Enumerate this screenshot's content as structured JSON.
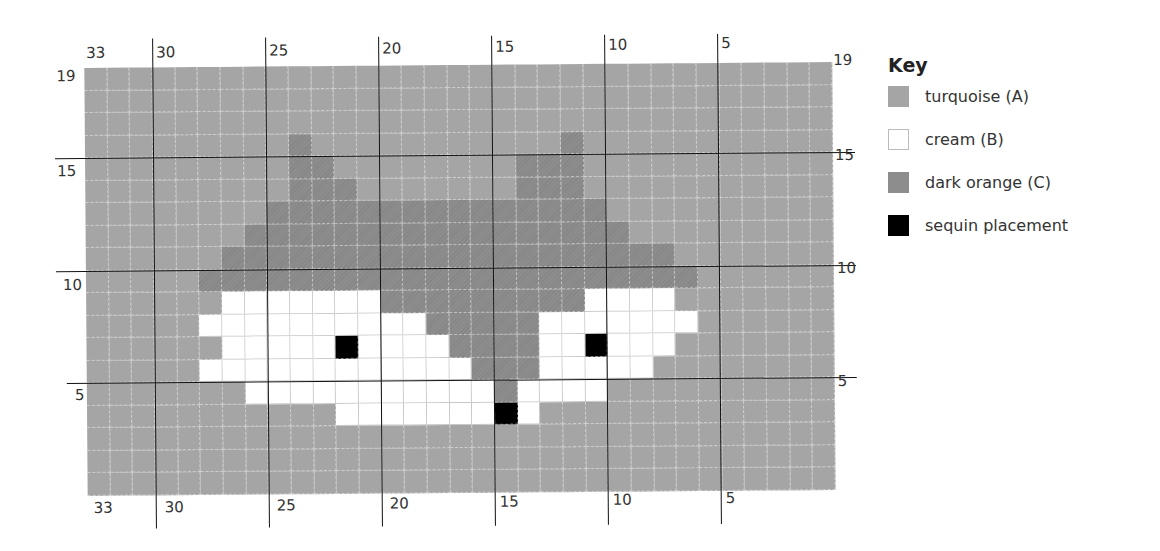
{
  "key": {
    "title": "Key",
    "items": [
      {
        "code": "A",
        "label": "turquoise (A)",
        "color": "#a5a5a5"
      },
      {
        "code": "B",
        "label": "cream (B)",
        "color": "#ffffff"
      },
      {
        "code": "C",
        "label": "dark orange (C)",
        "color": "#8d8d8d"
      },
      {
        "code": "S",
        "label": "sequin placement",
        "color": "#000000"
      }
    ]
  },
  "axes": {
    "top_labels": [
      "33",
      "30",
      "25",
      "20",
      "15",
      "10",
      "5"
    ],
    "bottom_labels": [
      "33",
      "30",
      "25",
      "20",
      "15",
      "10",
      "5"
    ],
    "left_labels": [
      "19",
      "15",
      "10",
      "5"
    ],
    "right_labels": [
      "19",
      "15",
      "10",
      "5"
    ]
  },
  "chart_data": {
    "type": "heatmap",
    "columns": 33,
    "rows": 19,
    "column_order": "33 (left) to 1 (right)",
    "row_order": "19 (top) to 1 (bottom)",
    "x_tick_labels": [
      "33",
      "30",
      "25",
      "20",
      "15",
      "10",
      "5"
    ],
    "y_tick_labels": [
      "19",
      "15",
      "10",
      "5"
    ],
    "legend": {
      "A": "turquoise (A)",
      "B": "cream (B)",
      "C": "dark orange (C)",
      "S": "sequin placement"
    },
    "grid": [
      "AAAAAAAAAAAAAAAAAAAAAAAAAAAAAAAAA",
      "AAAAAAAAAAAAAAAAAAAAAAAAAAAAAAAAA",
      "AAAAAAAAAAAAAAAAAAAAAAAAAAAAAAAAA",
      "AAAAAAAAACAAAAAAAAAAACAAAAAAAAAAA",
      "AAAAAAAAACCAAAAAAAACCCAAAAAAAAAAA",
      "AAAAAAAAACCCAAAAAAACCCAAAAAAAAAAA",
      "AAAAAAAACCCCCCCCCCCCCCCAAAAAAAAAA",
      "AAAAAAACCCCCCCCCCCCCCCCCAAAAAAAAA",
      "AAAAAACCCCCCCCCCCCCCCCCCCCAAAAAAA",
      "AAAAACCCCCCCCCCCCCCCCCCCCCCAAAAAA",
      "AAAAAABBBBBBBCCCCCCCCCBBBBAAAAAAA",
      "AAAAABBBBBBBBBBCCCCCBBBBBBBAAAAAA",
      "AAAAAABBBBBSBBBBCCCCBBSBBBAAAAAAA",
      "AAAAABBBBBBBBBBBBCCCBBBBBAAAAAAAA",
      "AAAAAAABBBBBBBBBBBCBBBBAAAAAAAAAA",
      "AAAAAAAAAAABBBBBBBSBAAAAAAAAAAAAA",
      "AAAAAAAAAAAAAAAAAAAAAAAAAAAAAAAAA",
      "AAAAAAAAAAAAAAAAAAAAAAAAAAAAAAAAA",
      "AAAAAAAAAAAAAAAAAAAAAAAAAAAAAAAAA"
    ],
    "sequin_positions": [
      {
        "row": 7,
        "col": 22
      },
      {
        "row": 7,
        "col": 11
      },
      {
        "row": 4,
        "col": 15
      }
    ]
  }
}
